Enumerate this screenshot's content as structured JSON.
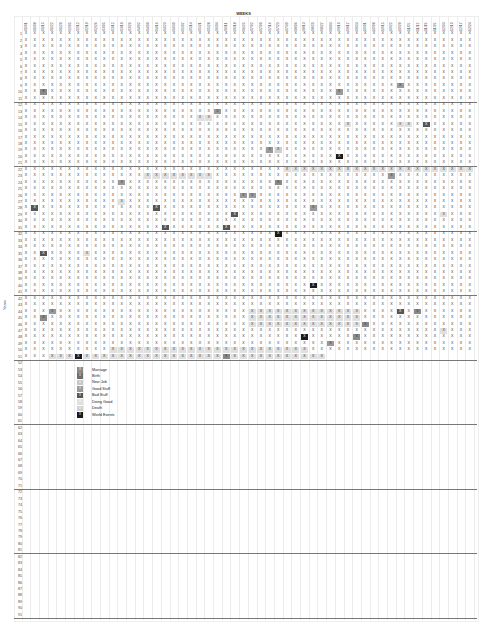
{
  "chart_data": {
    "type": "heatmap",
    "title": "WEEKS",
    "xlabel": "WEEKS",
    "ylabel": "Years",
    "weeks": [
      "01/01",
      "01/08",
      "01/15",
      "01/22",
      "01/29",
      "02/05",
      "02/12",
      "02/19",
      "02/26",
      "03/05",
      "03/12",
      "03/19",
      "03/26",
      "04/02",
      "04/09",
      "04/16",
      "04/23",
      "04/30",
      "05/07",
      "05/14",
      "05/21",
      "05/28",
      "06/04",
      "06/11",
      "06/18",
      "06/25",
      "07/02",
      "07/09",
      "07/16",
      "07/23",
      "07/30",
      "08/06",
      "08/13",
      "08/20",
      "08/27",
      "09/03",
      "09/10",
      "09/17",
      "09/24",
      "10/01",
      "10/08",
      "10/15",
      "10/22",
      "10/29",
      "11/05",
      "11/12",
      "11/19",
      "11/26",
      "12/03",
      "12/10",
      "12/17",
      "12/24"
    ],
    "years": 91,
    "filled_years": 51,
    "last_year_filled_weeks": 35,
    "cell_mark": "X",
    "separators_after_years": [
      11,
      21,
      31,
      41,
      51,
      61,
      71,
      81,
      91
    ],
    "legend": [
      {
        "label": "Marriage",
        "color": "#8a8a8a"
      },
      {
        "label": "Birth",
        "color": "#6e6e6e"
      },
      {
        "label": "New Job",
        "color": "#c8c8c8"
      },
      {
        "label": "Good Stuff",
        "color": "#9a9a9a"
      },
      {
        "label": "Bad Stuff",
        "color": "#555555"
      },
      {
        "label": "Doing Good",
        "color": "#e0e0e0"
      },
      {
        "label": "Death",
        "color": "#d0d0d0"
      },
      {
        "label": "World Events",
        "color": "#1a1a1a"
      }
    ],
    "events": [
      {
        "year": 9,
        "week": 44,
        "category": "Good Stuff"
      },
      {
        "year": 10,
        "week": 3,
        "category": "Marriage"
      },
      {
        "year": 10,
        "week": 37,
        "category": "Good Stuff"
      },
      {
        "year": 13,
        "week": 23,
        "category": "Good Stuff"
      },
      {
        "year": 15,
        "week": 44,
        "category": "Doing Good"
      },
      {
        "year": 15,
        "week": 45,
        "category": "Doing Good"
      },
      {
        "year": 15,
        "week": 47,
        "category": "Bad Stuff"
      },
      {
        "year": 15,
        "week": 38,
        "category": "Doing Good"
      },
      {
        "year": 19,
        "week": 29,
        "category": "Good Stuff"
      },
      {
        "year": 19,
        "week": 30,
        "category": "Death"
      },
      {
        "year": 20,
        "week": 37,
        "category": "World Events"
      },
      {
        "year": 23,
        "week": 43,
        "category": "Good Stuff"
      },
      {
        "year": 24,
        "week": 12,
        "category": "Good Stuff"
      },
      {
        "year": 24,
        "week": 30,
        "category": "Marriage"
      },
      {
        "year": 26,
        "week": 26,
        "category": "Good Stuff"
      },
      {
        "year": 26,
        "week": 27,
        "category": "Good Stuff"
      },
      {
        "year": 27,
        "week": 12,
        "category": "Doing Good"
      },
      {
        "year": 28,
        "week": 2,
        "category": "Bad Stuff"
      },
      {
        "year": 28,
        "week": 16,
        "category": "Bad Stuff"
      },
      {
        "year": 28,
        "week": 34,
        "category": "Good Stuff"
      },
      {
        "year": 29,
        "week": 25,
        "category": "Bad Stuff"
      },
      {
        "year": 29,
        "week": 49,
        "category": "Doing Good"
      },
      {
        "year": 31,
        "week": 17,
        "category": "Bad Stuff"
      },
      {
        "year": 31,
        "week": 24,
        "category": "Bad Stuff"
      },
      {
        "year": 32,
        "week": 30,
        "category": "World Events"
      },
      {
        "year": 35,
        "week": 3,
        "category": "Bad Stuff"
      },
      {
        "year": 35,
        "week": 8,
        "category": "Doing Good"
      },
      {
        "year": 40,
        "week": 34,
        "category": "World Events"
      },
      {
        "year": 44,
        "week": 4,
        "category": "Good Stuff"
      },
      {
        "year": 45,
        "week": 3,
        "category": "Marriage"
      },
      {
        "year": 44,
        "week": 44,
        "category": "Bad Stuff"
      },
      {
        "year": 44,
        "week": 46,
        "category": "Marriage"
      },
      {
        "year": 46,
        "week": 40,
        "category": "Marriage"
      },
      {
        "year": 47,
        "week": 49,
        "category": "Doing Good"
      },
      {
        "year": 48,
        "week": 33,
        "category": "World Events"
      },
      {
        "year": 48,
        "week": 39,
        "category": "Marriage"
      },
      {
        "year": 49,
        "week": 36,
        "category": "Good Stuff"
      },
      {
        "year": 51,
        "week": 7,
        "category": "World Events"
      },
      {
        "year": 51,
        "week": 24,
        "category": "Marriage"
      }
    ],
    "ranges": [
      {
        "year": 14,
        "from": 21,
        "to": 22,
        "category": "Doing Good"
      },
      {
        "year": 22,
        "from": 31,
        "to": 52,
        "category": "Doing Good"
      },
      {
        "year": 23,
        "from": 15,
        "to": 22,
        "category": "Doing Good"
      },
      {
        "year": 44,
        "from": 27,
        "to": 39,
        "category": "Doing Good"
      },
      {
        "year": 45,
        "from": 27,
        "to": 39,
        "category": "Doing Good"
      },
      {
        "year": 46,
        "from": 27,
        "to": 39,
        "category": "Doing Good"
      },
      {
        "year": 50,
        "from": 11,
        "to": 33,
        "category": "Doing Good"
      },
      {
        "year": 51,
        "from": 4,
        "to": 35,
        "category": "Doing Good"
      }
    ]
  }
}
